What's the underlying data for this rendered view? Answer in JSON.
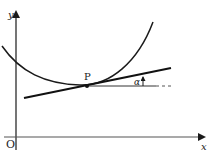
{
  "figure": {
    "labels": {
      "y_axis": "y",
      "x_axis": "x",
      "origin": "O",
      "point": "P",
      "angle": "α"
    },
    "colors": {
      "stroke": "#1a1a1a",
      "background": "#ffffff"
    }
  }
}
